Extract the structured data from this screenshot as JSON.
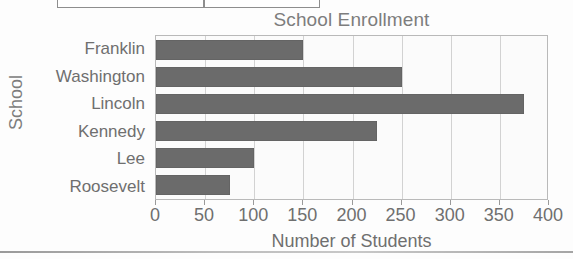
{
  "chart_data": {
    "type": "bar",
    "orientation": "horizontal",
    "title": "School Enrollment",
    "xlabel": "Number of Students",
    "ylabel": "School",
    "categories": [
      "Franklin",
      "Washington",
      "Lincoln",
      "Kennedy",
      "Lee",
      "Roosevelt"
    ],
    "values": [
      150,
      250,
      375,
      225,
      100,
      75
    ],
    "xlim": [
      0,
      400
    ],
    "xticks": [
      0,
      50,
      100,
      150,
      200,
      250,
      300,
      350,
      400
    ],
    "xtick_labels": [
      "0",
      "50",
      "100",
      "150",
      "200",
      "250",
      "300",
      "350",
      "400"
    ],
    "grid": true,
    "grid_axis": "x",
    "legend": false,
    "bar_color": "#6b6b6b",
    "plot_background": "#fbfbfb",
    "text_color": "#6f6f6f",
    "gridline_color": "#d2d2d2",
    "axis_color": "#b9b9b9"
  },
  "page": {
    "fragment_label": "",
    "fragment_divider_label": ""
  }
}
